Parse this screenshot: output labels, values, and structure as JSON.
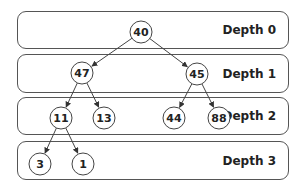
{
  "bands": [
    {
      "label": "Depth 0",
      "top": 11,
      "height": 38
    },
    {
      "label": "Depth 1",
      "top": 54,
      "height": 39
    },
    {
      "label": "Depth 2",
      "top": 97,
      "height": 38
    },
    {
      "label": "Depth 3",
      "top": 141,
      "height": 39
    }
  ],
  "nodes": [
    {
      "id": "n40",
      "value": "40",
      "x": 141,
      "y": 32
    },
    {
      "id": "n47",
      "value": "47",
      "x": 82,
      "y": 73
    },
    {
      "id": "n45",
      "value": "45",
      "x": 197,
      "y": 74
    },
    {
      "id": "n11",
      "value": "11",
      "x": 61,
      "y": 118
    },
    {
      "id": "n13",
      "value": "13",
      "x": 104,
      "y": 118
    },
    {
      "id": "n44",
      "value": "44",
      "x": 174,
      "y": 118
    },
    {
      "id": "n88",
      "value": "88",
      "x": 219,
      "y": 118
    },
    {
      "id": "n3",
      "value": "3",
      "x": 40,
      "y": 164
    },
    {
      "id": "n1",
      "value": "1",
      "x": 83,
      "y": 164
    }
  ],
  "edges": [
    [
      "n40",
      "n47"
    ],
    [
      "n40",
      "n45"
    ],
    [
      "n47",
      "n11"
    ],
    [
      "n47",
      "n13"
    ],
    [
      "n45",
      "n44"
    ],
    [
      "n45",
      "n88"
    ],
    [
      "n11",
      "n3"
    ],
    [
      "n11",
      "n1"
    ]
  ],
  "colors": {
    "stroke": "#444444",
    "text": "#222222",
    "background": "#ffffff"
  }
}
